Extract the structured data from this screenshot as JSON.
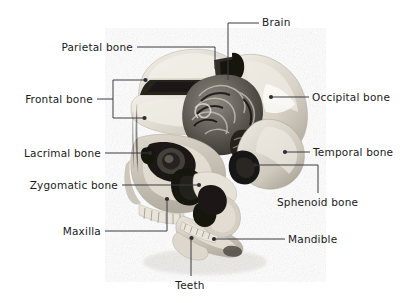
{
  "figure": {
    "background_color": "#ffffff",
    "text_color": "#1a1a1a",
    "leader_color": "#3a3a44",
    "width": 418,
    "height": 303
  },
  "labels": [
    {
      "id": "brain",
      "text": "Brain",
      "align": "left",
      "text_x": 262,
      "text_y": 22,
      "leader": "M228,80 L228,23 L259,23",
      "dot": null
    },
    {
      "id": "parietal-bone",
      "text": "Parietal bone",
      "align": "right",
      "text_x": 133,
      "text_y": 47,
      "leader": "M137,47 L215,47 L215,69",
      "dot": null
    },
    {
      "id": "frontal-bone",
      "text": "Frontal bone",
      "align": "right",
      "text_x": 93,
      "text_y": 99,
      "leader": "M97,99 L113,99 M113,80 L113,118 M113,80 L144,80 M113,118 L143,118",
      "dot": [
        [
          145.5,
          80
        ],
        [
          144.5,
          118
        ]
      ]
    },
    {
      "id": "occipital-bone",
      "text": "Occipital bone",
      "align": "left",
      "text_x": 312,
      "text_y": 97,
      "leader": "M273,97 L309,97",
      "dot": [
        [
          271,
          97
        ]
      ]
    },
    {
      "id": "lacrimal-bone",
      "text": "Lacrimal bone",
      "align": "right",
      "text_x": 101,
      "text_y": 153,
      "leader": "M105,153 L148,153",
      "dot": [
        [
          150,
          153
        ]
      ]
    },
    {
      "id": "temporal-bone",
      "text": "Temporal bone",
      "align": "left",
      "text_x": 313,
      "text_y": 152,
      "leader": "M287,152 L310,152",
      "dot": [
        [
          285,
          152
        ]
      ]
    },
    {
      "id": "zygomatic-bone",
      "text": "Zygomatic bone",
      "align": "right",
      "text_x": 118,
      "text_y": 185,
      "leader": "M122,185 L197,185",
      "dot": [
        [
          199,
          185
        ]
      ]
    },
    {
      "id": "sphenoid-bone",
      "text": "Sphenoid bone",
      "align": "left",
      "text_x": 277,
      "text_y": 202,
      "leader": "M257,165 L318,165 L318,193",
      "dot": [
        [
          255,
          165
        ]
      ]
    },
    {
      "id": "maxilla",
      "text": "Maxilla",
      "align": "right",
      "text_x": 101,
      "text_y": 231,
      "leader": "M105,231 L167,231 L167,201",
      "dot": [
        [
          167,
          199
        ]
      ]
    },
    {
      "id": "mandible",
      "text": "Mandible",
      "align": "left",
      "text_x": 288,
      "text_y": 239,
      "leader": "M216,239 L285,239",
      "dot": [
        [
          214,
          239
        ]
      ]
    },
    {
      "id": "teeth",
      "text": "Teeth",
      "align": "center",
      "text_x": 190,
      "text_y": 285,
      "leader": "M191,240 L191,276",
      "dot": [
        [
          191.5,
          238
        ]
      ]
    }
  ]
}
